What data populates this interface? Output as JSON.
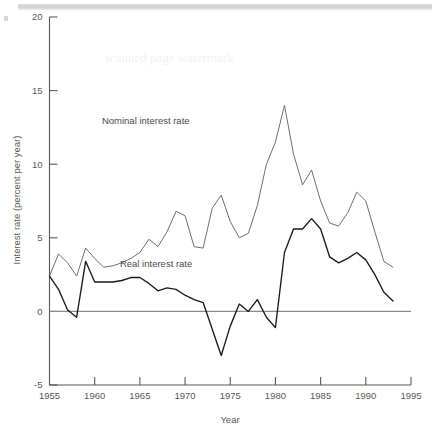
{
  "chart_data": {
    "type": "line",
    "title": "",
    "xlabel": "Year",
    "ylabel": "Interest rate (percent per year)",
    "xlim": [
      1955,
      1995
    ],
    "ylim": [
      -5,
      20
    ],
    "xticks": [
      1955,
      1960,
      1965,
      1970,
      1975,
      1980,
      1985,
      1990,
      1995
    ],
    "yticks": [
      -5,
      0,
      5,
      10,
      15,
      20
    ],
    "xtick_labels": [
      "1955",
      "1960",
      "1965",
      "1970",
      "1975",
      "1980",
      "1985",
      "1990",
      "1995"
    ],
    "ytick_labels": [
      "-5",
      "0",
      "5",
      "10",
      "15",
      "20"
    ],
    "grid": false,
    "legend_position": "inline-annotation",
    "zero_line": 0,
    "x": [
      1955,
      1956,
      1957,
      1958,
      1959,
      1960,
      1961,
      1962,
      1963,
      1964,
      1965,
      1966,
      1967,
      1968,
      1969,
      1970,
      1971,
      1972,
      1973,
      1974,
      1975,
      1976,
      1977,
      1978,
      1979,
      1980,
      1981,
      1982,
      1983,
      1984,
      1985,
      1986,
      1987,
      1988,
      1989,
      1990,
      1991,
      1992,
      1993
    ],
    "series": [
      {
        "name": "Nominal interest rate",
        "color": "#6e6e70",
        "values": [
          2.4,
          3.9,
          3.3,
          2.4,
          4.3,
          3.6,
          3.0,
          3.1,
          3.3,
          3.6,
          4.0,
          4.9,
          4.4,
          5.4,
          6.8,
          6.5,
          4.4,
          4.3,
          7.0,
          7.9,
          6.1,
          5.0,
          5.3,
          7.2,
          10.0,
          11.5,
          14.0,
          10.7,
          8.6,
          9.6,
          7.5,
          6.0,
          5.8,
          6.7,
          8.1,
          7.5,
          5.4,
          3.4,
          3.0
        ]
      },
      {
        "name": "Real interest rate",
        "color": "#1a1a1a",
        "values": [
          2.4,
          1.5,
          0.1,
          -0.4,
          3.4,
          2.0,
          2.0,
          2.0,
          2.1,
          2.3,
          2.3,
          1.9,
          1.4,
          1.6,
          1.5,
          1.1,
          0.8,
          0.6,
          -1.2,
          -3.0,
          -1.0,
          0.5,
          0.0,
          0.8,
          -0.4,
          -1.1,
          4.0,
          5.6,
          5.6,
          6.3,
          5.6,
          3.7,
          3.3,
          3.6,
          4.0,
          3.5,
          2.5,
          1.3,
          0.7
        ]
      }
    ],
    "annotations": [
      {
        "text": "Nominal interest rate",
        "x": 1970.5,
        "y": 12.7
      },
      {
        "text": "Real interest rate",
        "x": 1970.8,
        "y": 3.0
      }
    ]
  },
  "axes": {
    "y_axis_title": "Interest rate (percent per year)",
    "x_axis_title": "Year"
  },
  "artifacts": {
    "ghost_text": "scanned page watermark"
  }
}
